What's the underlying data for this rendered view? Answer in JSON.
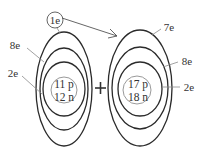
{
  "diagram": {
    "type": "ionic-bond-electron-transfer",
    "transfer_label": "1e",
    "plus_symbol": "+",
    "atoms": [
      {
        "name": "sodium",
        "nucleus": {
          "protons": "11 p",
          "neutrons": "12 n"
        },
        "shell_labels": [
          "2e",
          "8e"
        ],
        "valence_label": "1e"
      },
      {
        "name": "chlorine",
        "nucleus": {
          "protons": "17 p",
          "neutrons": "18 n"
        },
        "shell_labels": [
          "2e",
          "8e",
          "7e"
        ]
      }
    ],
    "colors": {
      "shell": "#2a2a2a",
      "nucleus": "#9a9a9a",
      "text": "#333333",
      "leader": "#8a8a8a"
    }
  }
}
